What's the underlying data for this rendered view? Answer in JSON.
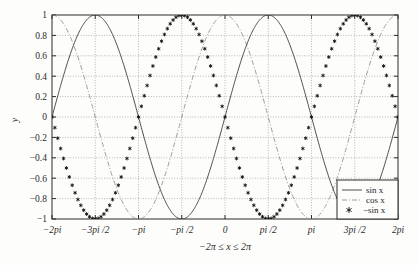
{
  "chart_data": {
    "type": "line",
    "title": "",
    "xlabel": "−2π ≤ x ≤ 2π",
    "ylabel": "y",
    "xlim": [
      -6.283185307179586,
      6.283185307179586
    ],
    "ylim": [
      -1,
      1
    ],
    "grid": true,
    "grid_style": "dotted",
    "legend_position": "lower-right",
    "xticks": [
      -6.283185307179586,
      -4.71238898038469,
      -3.141592653589793,
      -1.5707963267948966,
      0,
      1.5707963267948966,
      3.141592653589793,
      4.71238898038469,
      6.283185307179586
    ],
    "xtick_labels": [
      "−2pi",
      "−3pi /2",
      "−pi",
      "−pi /2",
      "0",
      "pi /2",
      "pi",
      "3pi /2",
      "2pi"
    ],
    "yticks": [
      -1,
      -0.8,
      -0.6,
      -0.4,
      -0.2,
      0,
      0.2,
      0.4,
      0.6,
      0.8,
      1
    ],
    "ytick_labels": [
      "−1",
      "−0.8",
      "−0.6",
      "−0.4",
      "−0.2",
      "0",
      "0.2",
      "0.4",
      "0.6",
      "0.8",
      "1"
    ],
    "series": [
      {
        "name": "sin x",
        "legend_label": "sin x",
        "style": "solid",
        "color": "#3a3a3a",
        "marker": "none",
        "formula": "sin(x)",
        "sample_points": [
          {
            "x": -6.2832,
            "y": 0.0
          },
          {
            "x": -4.7124,
            "y": 1.0
          },
          {
            "x": -3.1416,
            "y": 0.0
          },
          {
            "x": -1.5708,
            "y": -1.0
          },
          {
            "x": 0.0,
            "y": 0.0
          },
          {
            "x": 1.5708,
            "y": 1.0
          },
          {
            "x": 3.1416,
            "y": 0.0
          },
          {
            "x": 4.7124,
            "y": -1.0
          },
          {
            "x": 6.2832,
            "y": 0.0
          }
        ]
      },
      {
        "name": "cos x",
        "legend_label": "cos x",
        "style": "dashdot",
        "color": "#8f8f8f",
        "marker": "none",
        "formula": "cos(x)",
        "sample_points": [
          {
            "x": -6.2832,
            "y": 1.0
          },
          {
            "x": -4.7124,
            "y": 0.0
          },
          {
            "x": -3.1416,
            "y": -1.0
          },
          {
            "x": -1.5708,
            "y": 0.0
          },
          {
            "x": 0.0,
            "y": 1.0
          },
          {
            "x": 1.5708,
            "y": 0.0
          },
          {
            "x": 3.1416,
            "y": -1.0
          },
          {
            "x": 4.7124,
            "y": 0.0
          },
          {
            "x": 6.2832,
            "y": 1.0
          }
        ]
      },
      {
        "name": "-sin x",
        "legend_label": "−sin x",
        "style": "markers",
        "color": "#111111",
        "marker": "asterisk",
        "marker_count": 121,
        "formula": "-sin(x)",
        "sample_points": [
          {
            "x": -6.2832,
            "y": 0.0
          },
          {
            "x": -4.7124,
            "y": -1.0
          },
          {
            "x": -3.1416,
            "y": 0.0
          },
          {
            "x": -1.5708,
            "y": 1.0
          },
          {
            "x": 0.0,
            "y": 0.0
          },
          {
            "x": 1.5708,
            "y": -1.0
          },
          {
            "x": 3.1416,
            "y": 0.0
          },
          {
            "x": 4.7124,
            "y": 1.0
          },
          {
            "x": 6.2832,
            "y": 0.0
          }
        ]
      }
    ]
  },
  "legend": {
    "entries": [
      {
        "label": "sin x",
        "style": "solid"
      },
      {
        "label": "cos x",
        "style": "dashdot"
      },
      {
        "label": "−sin x",
        "style": "marker"
      }
    ]
  },
  "axes": {
    "y_axis_title": "y",
    "x_axis_title": "−2π ≤ x ≤ 2π"
  },
  "colors": {
    "background": "#fdfdfc",
    "axis": "#2b2b2b",
    "grid": "#9a9a9a",
    "sin": "#3a3a3a",
    "cos": "#8f8f8f",
    "neg_sin": "#111111"
  }
}
